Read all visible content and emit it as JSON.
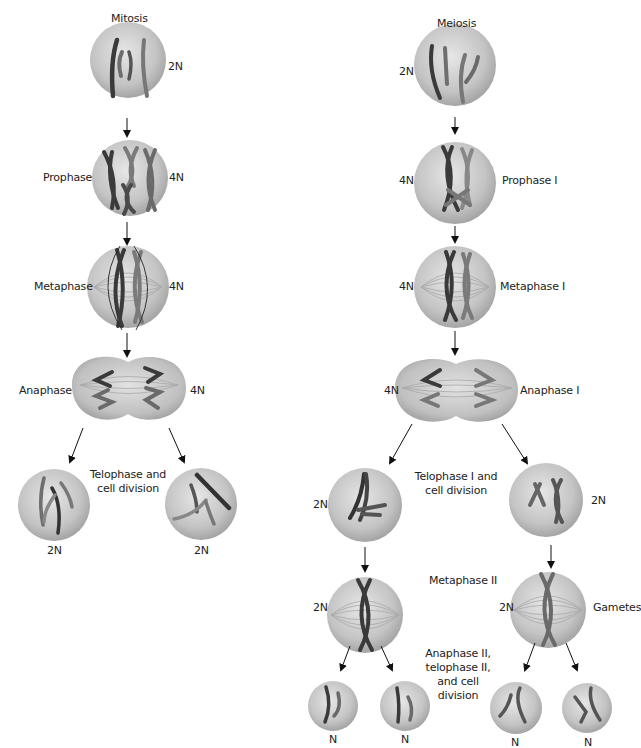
{
  "mitosis": {
    "title": "Mitosis",
    "stages": [
      {
        "id": "start",
        "label": "",
        "ploidy": "2N"
      },
      {
        "id": "prophase",
        "label": "Prophase",
        "ploidy": "4N"
      },
      {
        "id": "metaphase",
        "label": "Metaphase",
        "ploidy": "4N"
      },
      {
        "id": "anaphase",
        "label": "Anaphase",
        "ploidy": "4N"
      },
      {
        "id": "telophase",
        "label": "Telophase and cell division",
        "label_line1": "Telophase and",
        "label_line2": "cell division",
        "daughters": [
          "2N",
          "2N"
        ]
      }
    ]
  },
  "meiosis": {
    "title": "Meiosis",
    "stages": [
      {
        "id": "start",
        "label": "",
        "ploidy": "2N"
      },
      {
        "id": "prophase1",
        "label": "Prophase I",
        "ploidy": "4N"
      },
      {
        "id": "metaphase1",
        "label": "Metaphase I",
        "ploidy": "4N"
      },
      {
        "id": "anaphase1",
        "label": "Anaphase I",
        "ploidy": "4N"
      },
      {
        "id": "telophase1",
        "label": "Telophase I and cell division",
        "label_line1": "Telophase I and",
        "label_line2": "cell division",
        "daughters": [
          "2N",
          "2N"
        ]
      },
      {
        "id": "metaphase2",
        "label": "Metaphase II",
        "ploidy": [
          "2N",
          "2N"
        ]
      },
      {
        "id": "anaphase2",
        "label": "Anaphase II, telophase II, and cell division",
        "label_lines": [
          "Anaphase II,",
          "telophase II,",
          "and cell",
          "division"
        ],
        "gametes": [
          "N",
          "N",
          "N",
          "N"
        ]
      }
    ],
    "gametes_label": "Gametes"
  },
  "colors": {
    "cell_light": "#d9d9d9",
    "cell_dark": "#9a9a9a",
    "chromosome_dark": "#3a3a3a",
    "chromosome_mid": "#6e6e6e",
    "arrow": "#111111",
    "text": "#222222"
  }
}
